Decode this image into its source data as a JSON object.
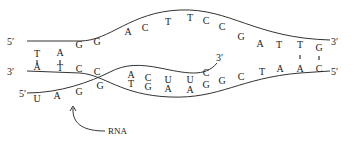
{
  "diagram": {
    "coding_strand": {
      "five_prime_label": "5′",
      "three_prime_label": "3′",
      "bases": [
        {
          "b": "T",
          "x": 37,
          "y": 57
        },
        {
          "b": "A",
          "x": 60,
          "y": 56
        },
        {
          "b": "G",
          "x": 79,
          "y": 48
        },
        {
          "b": "G",
          "x": 97,
          "y": 45
        },
        {
          "b": "A",
          "x": 128,
          "y": 35
        },
        {
          "b": "C",
          "x": 145,
          "y": 31
        },
        {
          "b": "T",
          "x": 168,
          "y": 25
        },
        {
          "b": "T",
          "x": 190,
          "y": 21
        },
        {
          "b": "C",
          "x": 206,
          "y": 24
        },
        {
          "b": "C",
          "x": 222,
          "y": 30
        },
        {
          "b": "G",
          "x": 241,
          "y": 40
        },
        {
          "b": "A",
          "x": 260,
          "y": 47
        },
        {
          "b": "T",
          "x": 279,
          "y": 48
        },
        {
          "b": "T",
          "x": 300,
          "y": 48
        },
        {
          "b": "G",
          "x": 319,
          "y": 51
        }
      ]
    },
    "template_strand": {
      "three_prime_label": "3′",
      "five_prime_label": "5′",
      "bases": [
        {
          "b": "A",
          "x": 37,
          "y": 70
        },
        {
          "b": "T",
          "x": 60,
          "y": 71
        },
        {
          "b": "C",
          "x": 79,
          "y": 72
        },
        {
          "b": "C",
          "x": 97,
          "y": 75
        },
        {
          "b": "T",
          "x": 131,
          "y": 87
        },
        {
          "b": "G",
          "x": 148,
          "y": 90
        },
        {
          "b": "A",
          "x": 168,
          "y": 92
        },
        {
          "b": "A",
          "x": 190,
          "y": 93
        },
        {
          "b": "G",
          "x": 206,
          "y": 88
        },
        {
          "b": "G",
          "x": 222,
          "y": 84
        },
        {
          "b": "C",
          "x": 241,
          "y": 80
        },
        {
          "b": "T",
          "x": 262,
          "y": 75
        },
        {
          "b": "A",
          "x": 280,
          "y": 72
        },
        {
          "b": "A",
          "x": 300,
          "y": 72
        },
        {
          "b": "C",
          "x": 319,
          "y": 72
        }
      ]
    },
    "rna": {
      "label": "RNA",
      "five_prime_label": "5′",
      "three_prime_label": "3′",
      "bases": [
        {
          "b": "U",
          "x": 37,
          "y": 102
        },
        {
          "b": "A",
          "x": 57,
          "y": 99
        },
        {
          "b": "G",
          "x": 79,
          "y": 95
        },
        {
          "b": "G",
          "x": 100,
          "y": 89
        },
        {
          "b": "A",
          "x": 131,
          "y": 78
        },
        {
          "b": "C",
          "x": 148,
          "y": 81
        },
        {
          "b": "U",
          "x": 168,
          "y": 83
        },
        {
          "b": "U",
          "x": 190,
          "y": 83
        },
        {
          "b": "C",
          "x": 206,
          "y": 76
        }
      ]
    },
    "base_pair_bonds": [
      {
        "x": 37,
        "y1": 60,
        "y2": 64
      },
      {
        "x": 60,
        "y1": 60,
        "y2": 64
      },
      {
        "x": 300,
        "y1": 55,
        "y2": 59
      },
      {
        "x": 319,
        "y1": 56,
        "y2": 60
      }
    ]
  }
}
